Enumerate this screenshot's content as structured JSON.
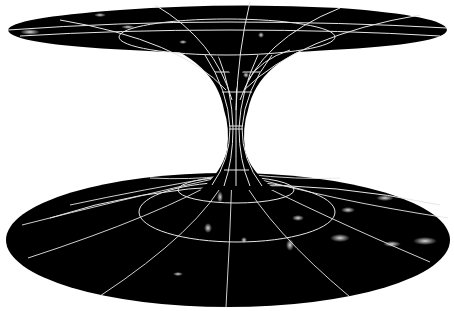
{
  "figure": {
    "colors": {
      "background": "#ffffff",
      "surface": "#000000",
      "grid": "#e6e6e6",
      "stars": "#ffffff"
    },
    "top_sheet": {
      "cx": 227,
      "cy": 30,
      "rx": 220,
      "ry": 26
    },
    "bottom_sheet": {
      "cx": 228,
      "cy": 240,
      "rx": 222,
      "ry": 67
    },
    "throat": {
      "cx": 236,
      "cy": 128,
      "half_width": 9
    }
  }
}
